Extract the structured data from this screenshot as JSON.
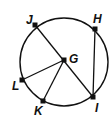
{
  "diagram": {
    "type": "circle-geometry",
    "circle": {
      "cx": 64,
      "cy": 62,
      "r": 44,
      "stroke": "#111111"
    },
    "center_label": "G",
    "points": [
      {
        "id": "J",
        "label": "J",
        "x": 35,
        "y": 25,
        "lx": 26,
        "ly": 24
      },
      {
        "id": "H",
        "label": "H",
        "x": 95,
        "y": 29,
        "lx": 93,
        "ly": 23
      },
      {
        "id": "G",
        "label": "G",
        "x": 64,
        "y": 60,
        "lx": 69,
        "ly": 63
      },
      {
        "id": "L",
        "label": "L",
        "x": 22,
        "y": 80,
        "lx": 12,
        "ly": 90
      },
      {
        "id": "K",
        "label": "K",
        "x": 43,
        "y": 101,
        "lx": 34,
        "ly": 115
      },
      {
        "id": "I",
        "label": "I",
        "x": 93,
        "y": 97,
        "lx": 95,
        "ly": 112
      }
    ],
    "segments": [
      {
        "from": "J",
        "to": "I"
      },
      {
        "from": "G",
        "to": "L"
      },
      {
        "from": "G",
        "to": "K"
      },
      {
        "from": "H",
        "to": "I"
      }
    ]
  }
}
